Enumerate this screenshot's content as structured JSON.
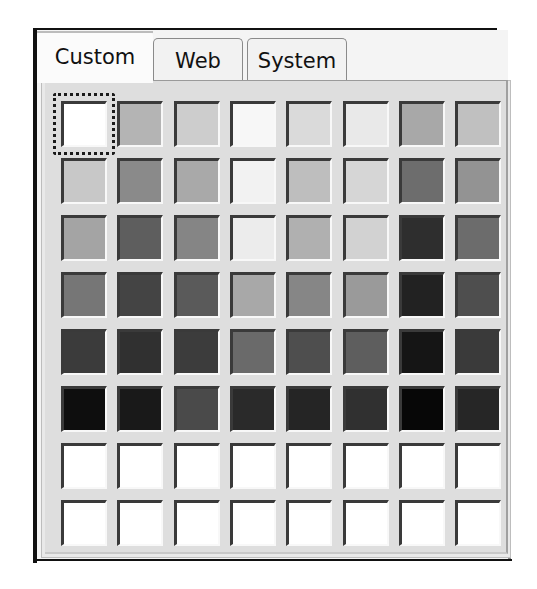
{
  "tabs": [
    {
      "label": "Custom",
      "active": true
    },
    {
      "label": "Web",
      "active": false
    },
    {
      "label": "System",
      "active": false
    }
  ],
  "palette": {
    "columns": 8,
    "rows": 8,
    "selected_index": 0,
    "colors": [
      [
        "#ffffff",
        "#b4b4b4",
        "#cdcdcd",
        "#f7f7f7",
        "#dadada",
        "#e9e9e9",
        "#a8a8a8",
        "#c0c0c0"
      ],
      [
        "#c8c8c8",
        "#8a8a8a",
        "#a9a9a9",
        "#f2f2f2",
        "#bebebe",
        "#d6d6d6",
        "#6d6d6d",
        "#939393"
      ],
      [
        "#a4a4a4",
        "#5e5e5e",
        "#858585",
        "#ececec",
        "#b0b0b0",
        "#d2d2d2",
        "#2e2e2e",
        "#6c6c6c"
      ],
      [
        "#767676",
        "#444444",
        "#5a5a5a",
        "#a8a8a8",
        "#868686",
        "#9a9a9a",
        "#222222",
        "#4e4e4e"
      ],
      [
        "#3b3b3b",
        "#303030",
        "#3c3c3c",
        "#6a6a6a",
        "#4e4e4e",
        "#5e5e5e",
        "#151515",
        "#3a3a3a"
      ],
      [
        "#0e0e0e",
        "#191919",
        "#4a4a4a",
        "#2a2a2a",
        "#252525",
        "#303030",
        "#070707",
        "#262626"
      ],
      [
        "#ffffff",
        "#ffffff",
        "#ffffff",
        "#ffffff",
        "#ffffff",
        "#ffffff",
        "#ffffff",
        "#ffffff"
      ],
      [
        "#ffffff",
        "#ffffff",
        "#ffffff",
        "#ffffff",
        "#ffffff",
        "#ffffff",
        "#ffffff",
        "#ffffff"
      ]
    ]
  }
}
